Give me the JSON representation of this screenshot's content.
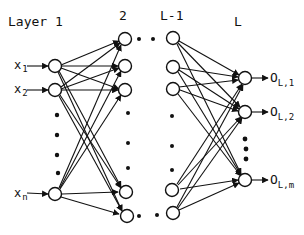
{
  "diagram": {
    "type": "multilayer-feedforward-neural-network",
    "layer_labels": [
      "Layer 1",
      "2",
      "L-1",
      "L"
    ],
    "inputs": [
      {
        "base": "x",
        "sub": "1"
      },
      {
        "base": "x",
        "sub": "2"
      },
      {
        "base": "x",
        "sub": "n"
      }
    ],
    "outputs": [
      {
        "base": "O",
        "sub": "L,1"
      },
      {
        "base": "O",
        "sub": "L,2"
      },
      {
        "base": "O",
        "sub": "L,m"
      }
    ],
    "ellipsis_between_layers": "• •",
    "colors": {
      "ink": "#111111",
      "background": "#ffffff"
    }
  }
}
